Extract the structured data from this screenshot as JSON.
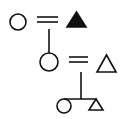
{
  "diagram": {
    "type": "kinship-diagram",
    "stroke_color": "#111111",
    "background": "#ffffff",
    "generations": [
      {
        "level": 1,
        "members": [
          {
            "symbol": "circle",
            "sex": "female",
            "filled": false
          },
          {
            "symbol": "triangle",
            "sex": "male",
            "filled": true
          }
        ],
        "relation": "marriage"
      },
      {
        "level": 2,
        "members": [
          {
            "symbol": "circle",
            "sex": "female",
            "filled": false
          },
          {
            "symbol": "triangle",
            "sex": "male",
            "filled": false
          }
        ],
        "relation": "marriage"
      },
      {
        "level": 3,
        "members": [
          {
            "symbol": "circle",
            "sex": "female",
            "filled": false
          },
          {
            "symbol": "triangle",
            "sex": "male",
            "filled": false
          }
        ],
        "relation": "siblings"
      }
    ]
  }
}
